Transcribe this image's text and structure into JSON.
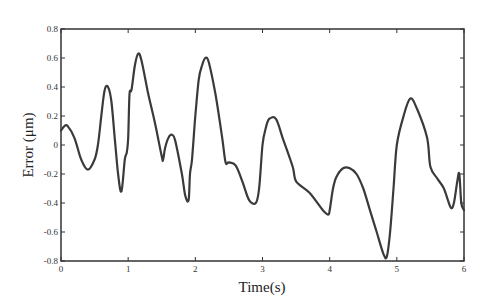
{
  "chart_data": {
    "type": "line",
    "title": "",
    "xlabel": "Time(s)",
    "ylabel": "Error (μm)",
    "xlim": [
      0,
      6
    ],
    "ylim": [
      -0.8,
      0.8
    ],
    "xticks": [
      0,
      1,
      2,
      3,
      4,
      5,
      6
    ],
    "yticks": [
      -0.8,
      -0.6,
      -0.4,
      -0.2,
      0,
      0.2,
      0.4,
      0.6,
      0.8
    ],
    "ytick_labels": [
      "-0.8",
      "-0.6",
      "-0.4",
      "-0.2",
      "0",
      "0.2",
      "0.4",
      "0.6",
      "0.8"
    ],
    "xtick_labels": [
      "0",
      "1",
      "2",
      "3",
      "4",
      "5",
      "6"
    ],
    "grid": false,
    "legend": null,
    "series": [
      {
        "name": "Error",
        "color": "#3a3a3a",
        "x": [
          0,
          0.05,
          0.1,
          0.2,
          0.3,
          0.4,
          0.5,
          0.55,
          0.6,
          0.65,
          0.7,
          0.75,
          0.8,
          0.85,
          0.9,
          0.95,
          0.98,
          1.0,
          1.02,
          1.05,
          1.1,
          1.15,
          1.2,
          1.3,
          1.4,
          1.5,
          1.52,
          1.55,
          1.6,
          1.65,
          1.7,
          1.8,
          1.85,
          1.9,
          1.92,
          1.95,
          2.0,
          2.05,
          2.1,
          2.15,
          2.2,
          2.3,
          2.4,
          2.45,
          2.5,
          2.6,
          2.7,
          2.8,
          2.9,
          2.95,
          3.0,
          3.05,
          3.1,
          3.2,
          3.3,
          3.45,
          3.5,
          3.7,
          3.9,
          3.98,
          4.0,
          4.05,
          4.1,
          4.2,
          4.3,
          4.4,
          4.5,
          4.6,
          4.7,
          4.8,
          4.85,
          4.9,
          4.95,
          5.0,
          5.1,
          5.2,
          5.3,
          5.45,
          5.5,
          5.6,
          5.7,
          5.8,
          5.85,
          5.9,
          5.93,
          5.96,
          6.0
        ],
        "y": [
          0.1,
          0.13,
          0.13,
          0.05,
          -0.1,
          -0.17,
          -0.1,
          0.0,
          0.2,
          0.38,
          0.4,
          0.3,
          0.05,
          -0.2,
          -0.32,
          -0.1,
          -0.05,
          0.05,
          0.35,
          0.38,
          0.55,
          0.63,
          0.58,
          0.35,
          0.15,
          -0.08,
          -0.1,
          -0.02,
          0.05,
          0.07,
          0.03,
          -0.2,
          -0.35,
          -0.38,
          -0.2,
          -0.1,
          0.2,
          0.45,
          0.55,
          0.6,
          0.57,
          0.35,
          0.05,
          -0.12,
          -0.12,
          -0.14,
          -0.25,
          -0.38,
          -0.4,
          -0.3,
          0.0,
          0.12,
          0.18,
          0.18,
          0.05,
          -0.15,
          -0.25,
          -0.33,
          -0.45,
          -0.48,
          -0.45,
          -0.3,
          -0.22,
          -0.16,
          -0.16,
          -0.2,
          -0.3,
          -0.45,
          -0.6,
          -0.75,
          -0.77,
          -0.6,
          -0.3,
          0.0,
          0.2,
          0.32,
          0.25,
          0.05,
          -0.15,
          -0.23,
          -0.3,
          -0.43,
          -0.4,
          -0.25,
          -0.2,
          -0.4,
          -0.45
        ]
      }
    ]
  }
}
